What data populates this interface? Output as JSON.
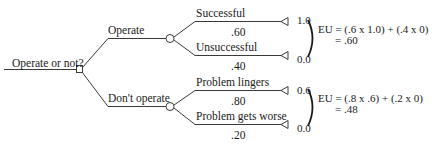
{
  "decision": {
    "label": "Operate or not?",
    "node_type": "decision-square"
  },
  "alternatives": [
    {
      "label": "Operate",
      "outcomes": [
        {
          "label": "Successful",
          "probability": ".60",
          "utility": "1.0"
        },
        {
          "label": "Unsuccessful",
          "probability": ".40",
          "utility": "0.0"
        }
      ],
      "eu_formula": "EU = (.6 x 1.0) + (.4 x 0)",
      "eu_result": "= .60"
    },
    {
      "label": "Don't operate",
      "outcomes": [
        {
          "label": "Problem lingers",
          "probability": ".80",
          "utility": "0.6"
        },
        {
          "label": "Problem gets worse",
          "probability": ".20",
          "utility": "0.0"
        }
      ],
      "eu_formula": "EU = (.8 x .6) + (.2 x 0)",
      "eu_result": "= .48"
    }
  ],
  "colors": {
    "line": "#3a3a3a",
    "text": "#1a1a1a",
    "background": "#ffffff"
  }
}
